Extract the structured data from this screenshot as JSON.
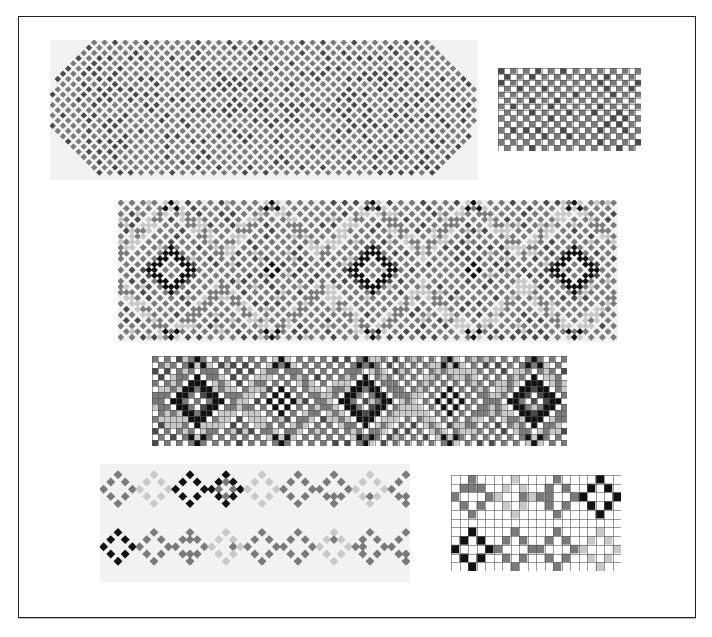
{
  "page": {
    "clipped_header_text": "",
    "frame": {
      "x": 18,
      "y": 16,
      "w": 676,
      "h": 600,
      "border_color": "#222222"
    }
  },
  "palette": {
    "white": "#ffffff",
    "light": "#c8c8c8",
    "mid": "#7a7a7a",
    "dark": "#4a4a4a",
    "black": "#111111",
    "gridline": "#555555",
    "photo_bg": "#f2f2f2"
  },
  "figures": [
    {
      "id": "band-1-photo",
      "kind": "beadwork-photo",
      "label": "Top beaded band (diamond lattice)",
      "x": 50,
      "y": 40,
      "w": 428,
      "h": 140,
      "cell": 5.2,
      "motif": "diamond-lattice",
      "rounded_ends": true
    },
    {
      "id": "band-1-chart",
      "kind": "pattern-chart",
      "label": "Pattern chart for top band",
      "x": 498,
      "y": 68,
      "w": 143,
      "h": 83,
      "cols": 23,
      "rows": 14,
      "motif": "checker-diamond"
    },
    {
      "id": "band-2-photo",
      "kind": "beadwork-photo",
      "label": "Middle beaded band (diamonds and chevrons)",
      "x": 118,
      "y": 200,
      "w": 500,
      "h": 142,
      "cell": 5.6,
      "motif": "diamond-chevron"
    },
    {
      "id": "band-2-chart",
      "kind": "pattern-chart",
      "label": "Pattern chart for middle band",
      "x": 152,
      "y": 356,
      "w": 415,
      "h": 90,
      "cols": 69,
      "rows": 15,
      "motif": "diamond-chevron"
    },
    {
      "id": "band-3-photo",
      "kind": "beadwork-photo",
      "label": "Bottom beaded band (cross motifs)",
      "x": 100,
      "y": 464,
      "w": 310,
      "h": 118,
      "cell": 7.2,
      "motif": "cross-motifs"
    },
    {
      "id": "band-3-chart",
      "kind": "pattern-chart",
      "label": "Pattern chart for bottom band",
      "x": 451,
      "y": 475,
      "w": 170,
      "h": 96,
      "cols": 20,
      "rows": 11,
      "motif": "cross-motifs"
    }
  ]
}
